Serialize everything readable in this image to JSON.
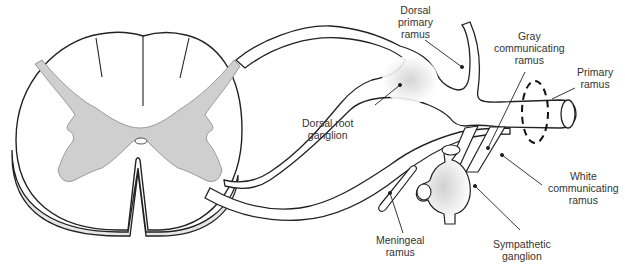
{
  "diagram": {
    "type": "anatomical",
    "colors": {
      "outline": "#222222",
      "gray_matter": "#cfcfcf",
      "ganglion_shade": "#d8d8d8",
      "white_matter": "#ffffff",
      "text": "#333333"
    },
    "labels": {
      "dorsal_primary_ramus": [
        "Dorsal",
        "primary",
        "ramus"
      ],
      "gray_communicating_ramus": [
        "Gray",
        "communicating",
        "ramus"
      ],
      "primary_ramus": [
        "Primary",
        "ramus"
      ],
      "dorsal_root_ganglion": [
        "Dorsal root",
        "ganglion"
      ],
      "white_communicating_ramus": [
        "White",
        "communicating",
        "ramus"
      ],
      "meningeal_ramus": [
        "Meningeal",
        "ramus"
      ],
      "sympathetic_ganglion": [
        "Sympathetic",
        "ganglion"
      ]
    }
  }
}
